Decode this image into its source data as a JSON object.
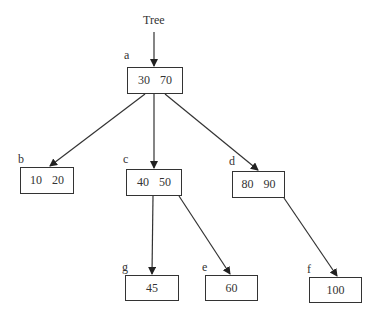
{
  "title": "Tree",
  "nodes": {
    "a": {
      "label": "a",
      "keys": [
        "30",
        "70"
      ]
    },
    "b": {
      "label": "b",
      "keys": [
        "10",
        "20"
      ]
    },
    "c": {
      "label": "c",
      "keys": [
        "40",
        "50"
      ]
    },
    "d": {
      "label": "d",
      "keys": [
        "80",
        "90"
      ]
    },
    "g": {
      "label": "g",
      "keys": [
        "45"
      ]
    },
    "e": {
      "label": "e",
      "keys": [
        "60"
      ]
    },
    "f": {
      "label": "f",
      "keys": [
        "100"
      ]
    }
  },
  "edges": [
    {
      "from": "Tree",
      "to": "a"
    },
    {
      "from": "a",
      "to": "b"
    },
    {
      "from": "a",
      "to": "c"
    },
    {
      "from": "a",
      "to": "d"
    },
    {
      "from": "c",
      "to": "g"
    },
    {
      "from": "c",
      "to": "e"
    },
    {
      "from": "d",
      "to": "f"
    }
  ]
}
